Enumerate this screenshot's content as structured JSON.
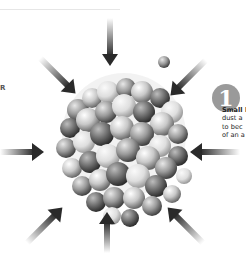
{
  "header": {
    "rule_color": "#e6e6e6"
  },
  "left_label": {
    "text": "R"
  },
  "step": {
    "number": "1",
    "circle_color": "#9a9a9a",
    "caption_lines": [
      "Small l",
      "dust a",
      "to bec",
      "of an a"
    ]
  },
  "illustration": {
    "subject": "cluster of gray spheres compressed from all sides",
    "arrow_count": 8,
    "arrow_color": "#2a2a2a",
    "arrows": [
      {
        "direction": "down",
        "position": "top"
      },
      {
        "direction": "down-right",
        "position": "top-left"
      },
      {
        "direction": "down-left",
        "position": "top-right"
      },
      {
        "direction": "right",
        "position": "left"
      },
      {
        "direction": "left",
        "position": "right"
      },
      {
        "direction": "up-right",
        "position": "bottom-left"
      },
      {
        "direction": "up",
        "position": "bottom"
      },
      {
        "direction": "up-left",
        "position": "bottom-right"
      }
    ]
  }
}
